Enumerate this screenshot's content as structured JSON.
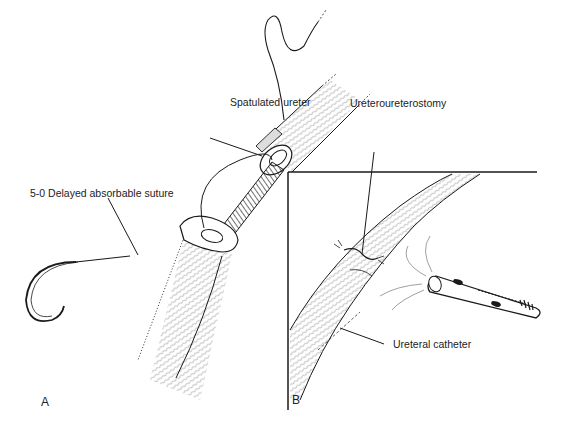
{
  "figure": {
    "panels": [
      {
        "id": "A",
        "letter": "A",
        "labels": {
          "spatulated": "Spatulated ureter",
          "suture": "5-0 Delayed absorbable suture"
        }
      },
      {
        "id": "B",
        "letter": "B",
        "labels": {
          "anastomosis": "Ureteroureterostomy",
          "catheter": "Ureteral catheter"
        }
      }
    ],
    "colors": {
      "ink": "#1a1a1a",
      "hatch": "#9a9a9a",
      "background": "#ffffff"
    }
  }
}
